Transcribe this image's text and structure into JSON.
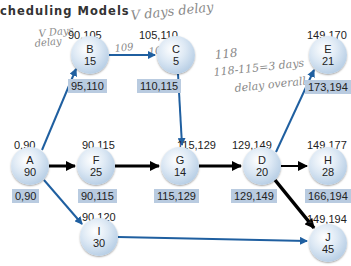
{
  "title": "cheduling Models",
  "colors": {
    "critical_arrow": "#000000",
    "noncritical_arrow": "#1f5fa0",
    "late_box": "#b9cbe0",
    "node_fill": "#c8daec"
  },
  "annotations": {
    "top_delay": "V days delay",
    "b_note_1": "V Days",
    "b_note_2": "delay",
    "b_ls_note": "109",
    "c_es_note": "109",
    "c_note_118": "118",
    "c_note_calc": "118-115=3 days",
    "c_note_overall": "delay overall"
  },
  "nodes": {
    "A": {
      "id": "A",
      "dur": "90",
      "es": "0,90",
      "ls": "0,90"
    },
    "B": {
      "id": "B",
      "dur": "15",
      "es": "90,105",
      "ls": "95,110"
    },
    "C": {
      "id": "C",
      "dur": "5",
      "es": "105,110",
      "ls": "110,115"
    },
    "F": {
      "id": "F",
      "dur": "25",
      "es": "90,115",
      "ls": "90,115"
    },
    "G": {
      "id": "G",
      "dur": "14",
      "es": "115,129",
      "ls": "115,129"
    },
    "D": {
      "id": "D",
      "dur": "20",
      "es": "129,149",
      "ls": "129,149"
    },
    "E": {
      "id": "E",
      "dur": "21",
      "es": "149,170",
      "ls": "173,194"
    },
    "H": {
      "id": "H",
      "dur": "28",
      "es": "149,177",
      "ls": "166,194"
    },
    "I": {
      "id": "I",
      "dur": "30",
      "es": "90,120",
      "ls": ""
    },
    "J": {
      "id": "J",
      "dur": "45",
      "es": "149,194",
      "ls": ""
    }
  },
  "edges": [
    {
      "from": "A",
      "to": "B",
      "critical": false
    },
    {
      "from": "A",
      "to": "F",
      "critical": true
    },
    {
      "from": "A",
      "to": "I",
      "critical": false
    },
    {
      "from": "B",
      "to": "C",
      "critical": false
    },
    {
      "from": "C",
      "to": "G",
      "critical": false
    },
    {
      "from": "F",
      "to": "G",
      "critical": true
    },
    {
      "from": "G",
      "to": "D",
      "critical": true
    },
    {
      "from": "D",
      "to": "E",
      "critical": false
    },
    {
      "from": "D",
      "to": "H",
      "critical": true
    },
    {
      "from": "D",
      "to": "J",
      "critical": true
    },
    {
      "from": "I",
      "to": "J",
      "critical": false
    }
  ]
}
